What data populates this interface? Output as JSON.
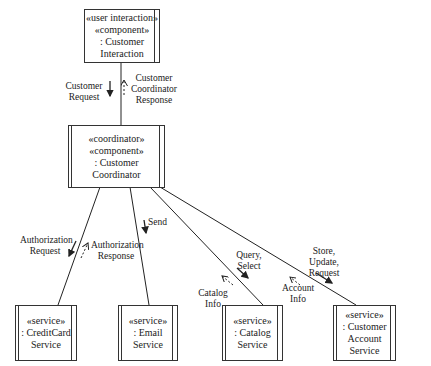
{
  "nodes": {
    "customer_interaction": {
      "line1": "«user interaction»",
      "line2": "«component»",
      "line3": ": Customer",
      "line4": "Interaction"
    },
    "customer_coordinator": {
      "line1": "«coordinator»",
      "line2": "«component»",
      "line3": ": Customer",
      "line4": "Coordinator"
    },
    "creditcard_service": {
      "line1": "«service»",
      "line2": ": CreditCard",
      "line3": "Service"
    },
    "email_service": {
      "line1": "«service»",
      "line2": ": Email",
      "line3": "Service"
    },
    "catalog_service": {
      "line1": "«service»",
      "line2": ": Catalog",
      "line3": "Service"
    },
    "account_service": {
      "line1": "«service»",
      "line2": ": Customer",
      "line3": "Account",
      "line4": "Service"
    }
  },
  "messages": {
    "customer_request": {
      "line1": "Customer",
      "line2": "Request"
    },
    "coordinator_response": {
      "line1": "Customer",
      "line2": "Coordinator",
      "line3": "Response"
    },
    "authorization_request": {
      "line1": "Authorization",
      "line2": "Request"
    },
    "authorization_response": {
      "line1": "Authorization",
      "line2": "Response"
    },
    "send": {
      "line1": "Send"
    },
    "query_select": {
      "line1": "Query,",
      "line2": "Select"
    },
    "catalog_info": {
      "line1": "Catalog",
      "line2": "Info"
    },
    "store_update_request": {
      "line1": "Store,",
      "line2": "Update,",
      "line3": "Request"
    },
    "account_info": {
      "line1": "Account",
      "line2": "Info"
    }
  }
}
